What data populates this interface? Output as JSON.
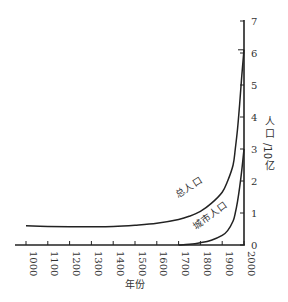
{
  "chart_data": {
    "type": "line",
    "title": "",
    "xlabel": "年份",
    "ylabel": "人口/10亿",
    "xlim": [
      1000,
      2000
    ],
    "ylim": [
      0,
      7
    ],
    "grid": false,
    "legend_position": "inline-labels",
    "x_ticks": [
      "1000",
      "1100",
      "1200",
      "1300",
      "1400",
      "1500",
      "1600",
      "1700",
      "1800",
      "1900",
      "2000"
    ],
    "y_ticks": [
      "0",
      "1",
      "2",
      "3",
      "4",
      "5",
      "6",
      "7"
    ],
    "series": [
      {
        "name": "总人口",
        "x": [
          1000,
          1100,
          1200,
          1300,
          1400,
          1500,
          1600,
          1700,
          1750,
          1800,
          1850,
          1900,
          1925,
          1950,
          1960,
          1970,
          1980,
          1990,
          2000
        ],
        "values": [
          0.6,
          0.58,
          0.57,
          0.57,
          0.58,
          0.62,
          0.68,
          0.8,
          0.9,
          1.05,
          1.3,
          1.65,
          2.0,
          2.5,
          3.0,
          3.6,
          4.4,
          5.3,
          6.1
        ]
      },
      {
        "name": "城市人口",
        "x": [
          1700,
          1750,
          1800,
          1850,
          1900,
          1925,
          1950,
          1960,
          1970,
          1980,
          1990,
          2000
        ],
        "values": [
          0.0,
          0.02,
          0.07,
          0.15,
          0.3,
          0.45,
          0.75,
          1.0,
          1.35,
          1.8,
          2.35,
          3.0
        ]
      }
    ],
    "annotations": [
      {
        "text": "总人口",
        "near_series": "总人口"
      },
      {
        "text": "城市人口",
        "near_series": "城市人口"
      }
    ]
  }
}
